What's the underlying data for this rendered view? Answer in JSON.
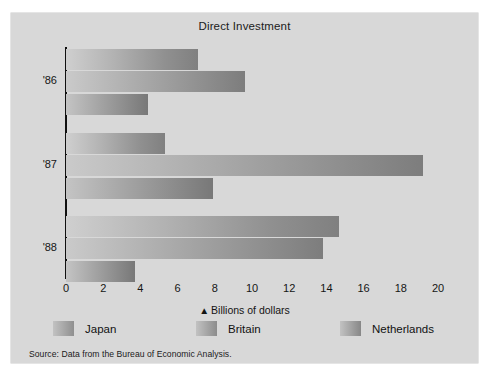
{
  "figure": {
    "background_color": "#d8d8d8",
    "page_color": "#ffffff"
  },
  "title": "Direct Investment",
  "axis_caption": {
    "marker": "▲",
    "text": "Billions of dollars"
  },
  "source_note": "Source: Data from the Bureau of Economic Analysis.",
  "legend": {
    "items": [
      {
        "label": "Japan",
        "color": "#8f8f8f"
      },
      {
        "label": "Britain",
        "color": "#8c8c8c"
      },
      {
        "label": "Netherlands",
        "color": "#878787"
      }
    ]
  },
  "chart_data": {
    "type": "bar",
    "orientation": "horizontal",
    "title": "Direct Investment",
    "xlabel": "Billions of dollars",
    "ylabel": "",
    "xlim": [
      0,
      20
    ],
    "xticks": [
      0,
      2,
      4,
      6,
      8,
      10,
      12,
      14,
      16,
      18,
      20
    ],
    "xtick_labels": [
      "0",
      "2",
      "4",
      "6",
      "8",
      "10",
      "12",
      "14",
      "16",
      "18",
      "20"
    ],
    "grid": false,
    "legend_position": "bottom",
    "categories": [
      "'86",
      "'87",
      "'88"
    ],
    "series": [
      {
        "name": "Japan",
        "values": [
          7.1,
          5.3,
          14.7
        ]
      },
      {
        "name": "Britain",
        "values": [
          9.6,
          19.2,
          13.8
        ]
      },
      {
        "name": "Netherlands",
        "values": [
          4.4,
          7.9,
          3.7
        ]
      }
    ],
    "source": "Source: Data from the Bureau of Economic Analysis."
  }
}
